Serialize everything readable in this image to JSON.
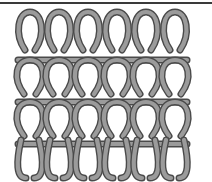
{
  "diagram": {
    "kind": "knitting-stitch-structure",
    "columns": 6,
    "rows": 3,
    "colors": {
      "yarn_fill": "#9b9b9b",
      "yarn_outline": "#4a4a4a",
      "background": "#ffffff",
      "border": "#3a3a3a"
    }
  }
}
